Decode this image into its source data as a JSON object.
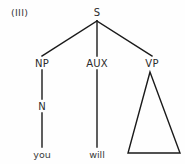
{
  "figure": {
    "example_number": "(III)",
    "background_color": "#fefefe",
    "line_color": "#1a1a1a",
    "text_color": "#2b2b2b"
  },
  "tree": {
    "root": {
      "label": "S",
      "x": 97,
      "y": 12
    },
    "nodes": [
      {
        "id": "np",
        "label": "NP",
        "x": 42,
        "y": 63
      },
      {
        "id": "aux",
        "label": "AUX",
        "x": 97,
        "y": 63
      },
      {
        "id": "vp",
        "label": "VP",
        "x": 152,
        "y": 63
      },
      {
        "id": "n",
        "label": "N",
        "x": 42,
        "y": 106
      }
    ],
    "terminals": [
      {
        "id": "you",
        "label": "you",
        "x": 42,
        "y": 154
      },
      {
        "id": "will",
        "label": "will",
        "x": 97,
        "y": 154
      }
    ],
    "triangle": {
      "apex_x": 150,
      "apex_y": 72,
      "base_left_x": 128,
      "base_right_x": 180,
      "base_y": 153
    }
  }
}
